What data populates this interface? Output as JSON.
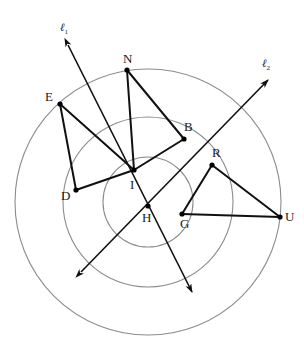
{
  "figure": {
    "colors": {
      "circle_stroke": "#8c8c8c",
      "segment_stroke": "#101010",
      "ray_stroke": "#101010",
      "point_fill": "#000000",
      "label_color": "#1a1a1a",
      "background": "#ffffff"
    }
  },
  "circles": [
    {
      "name": "outer-circle",
      "cx": 148,
      "cy": 202,
      "r": 133
    },
    {
      "name": "middle-circle",
      "cx": 148,
      "cy": 202,
      "r": 85
    },
    {
      "name": "inner-circle",
      "cx": 148,
      "cy": 202,
      "r": 45
    }
  ],
  "points": [
    {
      "id": "E",
      "label": "E",
      "x": 60,
      "y": 104,
      "lx": 45,
      "ly": 90
    },
    {
      "id": "N",
      "label": "N",
      "x": 127,
      "y": 70,
      "lx": 123,
      "ly": 52
    },
    {
      "id": "B",
      "label": "B",
      "x": 184,
      "y": 139,
      "lx": 184,
      "ly": 120
    },
    {
      "id": "R",
      "label": "R",
      "x": 212,
      "y": 165,
      "lx": 212,
      "ly": 146
    },
    {
      "id": "D",
      "label": "D",
      "x": 76,
      "y": 190,
      "lx": 61,
      "ly": 189
    },
    {
      "id": "I",
      "label": "I",
      "x": 134,
      "y": 170,
      "lx": 130,
      "ly": 178
    },
    {
      "id": "H",
      "label": "H",
      "x": 148,
      "y": 206,
      "lx": 142,
      "ly": 211
    },
    {
      "id": "G",
      "label": "G",
      "x": 182,
      "y": 214,
      "lx": 180,
      "ly": 217
    },
    {
      "id": "U",
      "label": "U",
      "x": 280,
      "y": 217,
      "lx": 285,
      "ly": 210
    }
  ],
  "segments": [
    {
      "name": "segment-E-D",
      "from": "E",
      "to": "D"
    },
    {
      "name": "segment-E-I",
      "from": "E",
      "to": "I"
    },
    {
      "name": "segment-D-I",
      "from": "D",
      "to": "I"
    },
    {
      "name": "segment-N-I",
      "from": "N",
      "to": "I"
    },
    {
      "name": "segment-N-B",
      "from": "N",
      "to": "B"
    },
    {
      "name": "segment-B-I",
      "from": "B",
      "to": "I"
    },
    {
      "name": "segment-R-G",
      "from": "R",
      "to": "G"
    },
    {
      "name": "segment-R-U",
      "from": "R",
      "to": "U"
    },
    {
      "name": "segment-G-U",
      "from": "G",
      "to": "U"
    }
  ],
  "rays": [
    {
      "id": "l1",
      "name": "ray-l1",
      "label": "ℓ",
      "sub": "1",
      "label_x": 60,
      "label_y": 22,
      "x1": 68,
      "y1": 45,
      "x2": 192,
      "y2": 292,
      "arrow_start": true,
      "arrow_end": true
    },
    {
      "id": "l2",
      "name": "ray-l2",
      "label": "ℓ",
      "sub": "2",
      "label_x": 262,
      "label_y": 58,
      "x1": 81,
      "y1": 272,
      "x2": 268,
      "y2": 80,
      "arrow_start": true,
      "arrow_end": true
    }
  ]
}
